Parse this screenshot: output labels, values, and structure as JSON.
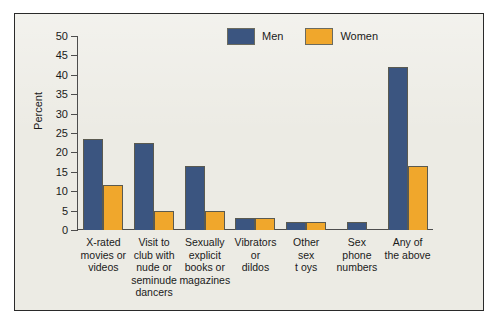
{
  "chart_data": {
    "type": "bar",
    "title": "",
    "xlabel": "",
    "ylabel": "Percent",
    "ylim": [
      0,
      50
    ],
    "ytick_step": 5,
    "yticks": [
      0,
      5,
      10,
      15,
      20,
      25,
      30,
      35,
      40,
      45,
      50
    ],
    "grid": false,
    "legend_position": "top-right",
    "categories": [
      "X-rated movies or videos",
      "Visit to club with nude or seminude dancers",
      "Sexually explicit books or magazines",
      "Vibrators or dildos",
      "Other sex toys",
      "Sex phone numbers",
      "Any of the above"
    ],
    "category_lines": [
      [
        "X-rated",
        "movies or",
        "videos"
      ],
      [
        "Visit to",
        "club with",
        "nude or",
        "seminude",
        "dancers"
      ],
      [
        "Sexually",
        "explicit",
        "books or",
        "magazines"
      ],
      [
        "Vibrators",
        "or",
        "dildos"
      ],
      [
        "Other",
        "sex",
        "t oys"
      ],
      [
        "Sex",
        "phone",
        "numbers"
      ],
      [
        "Any of",
        "the above"
      ]
    ],
    "series": [
      {
        "name": "Men",
        "color": "#3b5580",
        "values": [
          23.5,
          22.5,
          16.5,
          3,
          2,
          2,
          42
        ]
      },
      {
        "name": "Women",
        "color": "#f0a72c",
        "values": [
          11.5,
          5,
          5,
          3,
          2,
          0,
          16.5
        ]
      }
    ]
  },
  "legend": {
    "entries": [
      {
        "label": "Men",
        "color": "#3b5580"
      },
      {
        "label": "Women",
        "color": "#f0a72c"
      }
    ]
  },
  "colors": {
    "men": "#3b5580",
    "women": "#f0a72c",
    "plot_background": "#ecebe4",
    "frame_border": "#2a2a2a",
    "axis": "#4d4d4d",
    "text": "#1a1a1a"
  }
}
